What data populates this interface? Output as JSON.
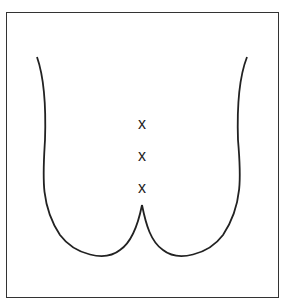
{
  "diagram": {
    "stroke_color": "#222222",
    "frame_color": "#333333",
    "marks": [
      {
        "label": "x",
        "x": 142,
        "y": 116
      },
      {
        "label": "x",
        "x": 142,
        "y": 150
      },
      {
        "label": "x",
        "x": 142,
        "y": 182
      }
    ]
  }
}
